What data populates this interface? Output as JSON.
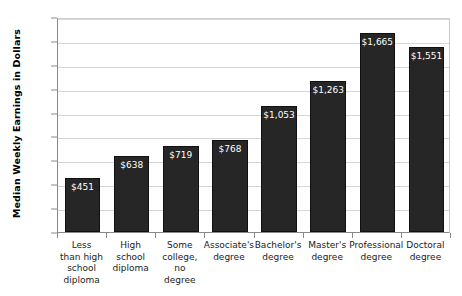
{
  "chart_data": {
    "type": "bar",
    "title": "",
    "subtitle": "",
    "xlabel": "",
    "ylabel": "Median Weekly Earnings in Dollars",
    "ylim": [
      0,
      1800
    ],
    "ytick_step": 200,
    "grid": true,
    "legend": "none",
    "bar_color": "#262626",
    "value_label_color": "#ffffff",
    "gridline_color": "#d6d6d6",
    "axis_color": "#8a8a8a",
    "ytick_labels": [
      "1,800",
      "1,600",
      "1,400",
      "1,200",
      "1,000",
      "800",
      "600",
      "400",
      "200",
      "0"
    ],
    "ytick_values": [
      1800,
      1600,
      1400,
      1200,
      1000,
      800,
      600,
      400,
      200,
      0
    ],
    "categories": [
      "Less\nthan high\nschool\ndiploma",
      "High\nschool\ndiploma",
      "Some\ncollege,\nno\ndegree",
      "Associate's\ndegree",
      "Bachelor's\ndegree",
      "Master's\ndegree",
      "Professional\ndegree",
      "Doctoral\ndegree"
    ],
    "values": [
      451,
      638,
      719,
      768,
      1053,
      1263,
      1665,
      1551
    ],
    "value_labels": [
      "$451",
      "$638",
      "$719",
      "$768",
      "$1,053",
      "$1,263",
      "$1,665",
      "$1,551"
    ]
  }
}
